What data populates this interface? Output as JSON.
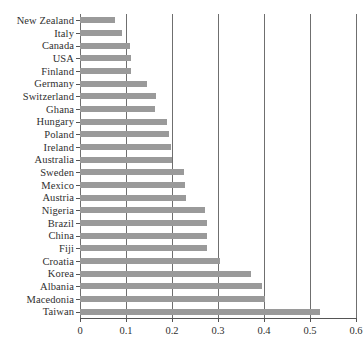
{
  "chart_data": {
    "type": "bar",
    "orientation": "horizontal",
    "title": "",
    "subtitle": "",
    "xlabel": "",
    "ylabel": "",
    "xlim": [
      0,
      0.6
    ],
    "grid": true,
    "legend": null,
    "bar_color": "#9a9a9a",
    "gridline_color": "#6f6f6f",
    "xticks": [
      0,
      0.1,
      0.2,
      0.3,
      0.4,
      0.5,
      0.6
    ],
    "xtick_labels": [
      "0",
      "0.1",
      "0.2",
      "0.3",
      "0.4",
      "0.5",
      "0.6"
    ],
    "categories": [
      "New Zealand",
      "Italy",
      "Canada",
      "USA",
      "Finland",
      "Germany",
      "Switzerland",
      "Ghana",
      "Hungary",
      "Poland",
      "Ireland",
      "Australia",
      "Sweden",
      "Mexico",
      "Austria",
      "Nigeria",
      "Brazil",
      "China",
      "Fiji",
      "Croatia",
      "Korea",
      "Albania",
      "Macedonia",
      "Taiwan"
    ],
    "values": [
      0.076,
      0.091,
      0.108,
      0.11,
      0.111,
      0.146,
      0.165,
      0.163,
      0.19,
      0.193,
      0.197,
      0.2,
      0.227,
      0.228,
      0.23,
      0.272,
      0.276,
      0.277,
      0.277,
      0.305,
      0.371,
      0.396,
      0.402,
      0.521
    ]
  }
}
